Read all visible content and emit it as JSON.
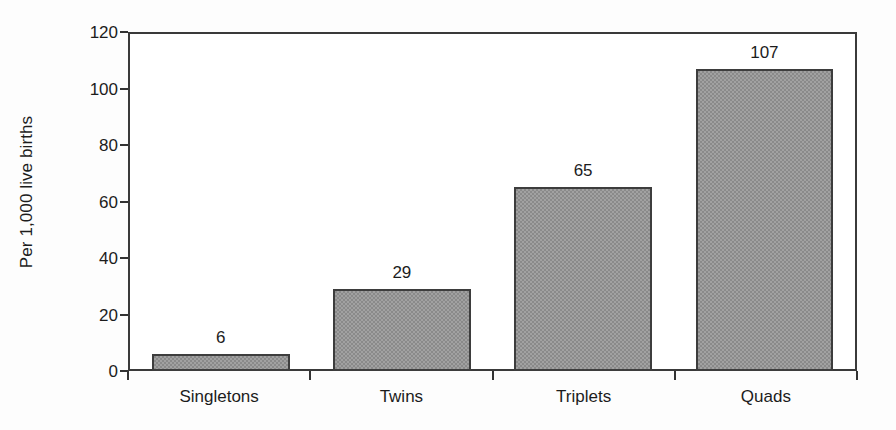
{
  "chart_data": {
    "type": "bar",
    "title": "",
    "subtitle": "",
    "xlabel": "",
    "ylabel": "Per 1,000 live births",
    "categories": [
      "Singletons",
      "Twins",
      "Triplets",
      "Quads"
    ],
    "values": [
      6,
      29,
      65,
      107
    ],
    "value_labels": [
      "6",
      "29",
      "65",
      "107"
    ],
    "ylim": [
      0,
      120
    ],
    "ytick_values": [
      0,
      20,
      40,
      60,
      80,
      100,
      120
    ],
    "ytick_labels": [
      "0",
      "20",
      "40",
      "60",
      "80",
      "100",
      "120"
    ],
    "grid": false,
    "legend": false,
    "legend_position": "none",
    "bar_color": "#8a8a8a",
    "bar_edge_color": "#3d3d3d",
    "axis_color": "#3a3a3a",
    "text_color": "#1c1c1c",
    "background_color": "#ffffff"
  }
}
